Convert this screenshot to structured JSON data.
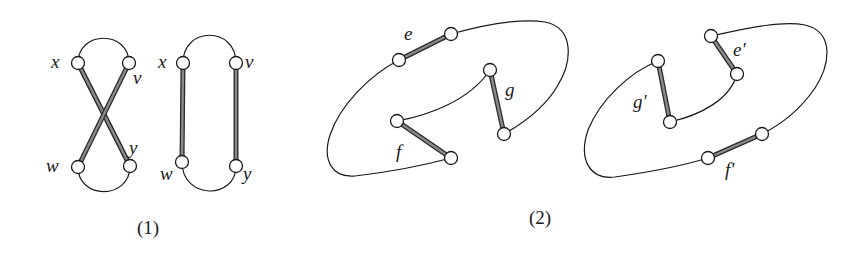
{
  "figure1": {
    "caption": "(1)",
    "left_graph": {
      "labels": {
        "x": "x",
        "v": "v",
        "w": "w",
        "y": "y"
      },
      "thick_edges": [
        "x-y",
        "v-w"
      ],
      "thin_arcs": [
        "x-v (top)",
        "w-y (bottom)"
      ]
    },
    "right_graph": {
      "labels": {
        "x": "x",
        "v": "v",
        "w": "w",
        "y": "y"
      },
      "thick_edges": [
        "x-w",
        "v-y"
      ],
      "thin_arcs": [
        "x-v (top)",
        "w-y (bottom)"
      ]
    }
  },
  "figure2": {
    "caption": "(2)",
    "left_graph": {
      "labels": {
        "e": "e",
        "f": "f",
        "g": "g"
      },
      "thick_edges": [
        "e",
        "f",
        "g"
      ]
    },
    "right_graph": {
      "labels": {
        "e": "e'",
        "f": "f'",
        "g": "g'"
      },
      "thick_edges": [
        "e'",
        "f'",
        "g'"
      ]
    }
  },
  "colors": {
    "line": "#1a1a1a",
    "thick_edge_fill": "#8a8a8a",
    "node_fill": "#ffffff",
    "background": "#ffffff"
  }
}
